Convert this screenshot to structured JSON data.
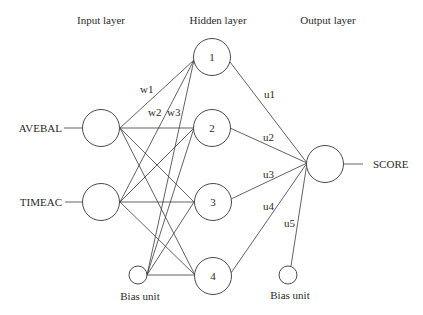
{
  "diagram": {
    "type": "neural-network",
    "layers": {
      "input": {
        "title": "Input layer"
      },
      "hidden": {
        "title": "Hidden layer"
      },
      "output": {
        "title": "Output layer"
      }
    },
    "inputs": [
      {
        "label": "AVEBAL"
      },
      {
        "label": "TIMEAC"
      }
    ],
    "input_bias": {
      "label": "Bias unit"
    },
    "hidden_nodes": [
      {
        "label": "1"
      },
      {
        "label": "2"
      },
      {
        "label": "3"
      },
      {
        "label": "4"
      }
    ],
    "output_bias": {
      "label": "Bias unit"
    },
    "output": {
      "label": "SCORE"
    },
    "input_weights": [
      "w1",
      "w2",
      "w3"
    ],
    "output_weights": [
      "u1",
      "u2",
      "u3",
      "u4",
      "u5"
    ],
    "colors": {
      "stroke": "#4a4a4a",
      "text": "#2a2a2a",
      "background": "#ffffff"
    }
  }
}
